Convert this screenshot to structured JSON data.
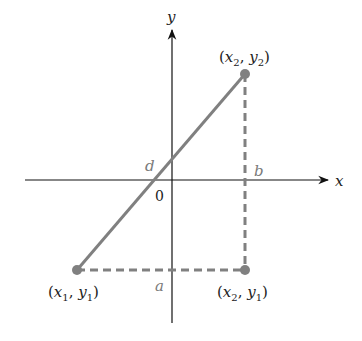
{
  "diagram": {
    "type": "distance-between-points",
    "axes": {
      "x_label": "x",
      "y_label": "y",
      "origin_label": "0"
    },
    "points": [
      {
        "id": "p1",
        "label": "(x1, y1)",
        "var_x": "x",
        "sub_x": "1",
        "var_y": "y",
        "sub_y": "1"
      },
      {
        "id": "p2",
        "label": "(x2, y2)",
        "var_x": "x",
        "sub_x": "2",
        "var_y": "y",
        "sub_y": "2"
      },
      {
        "id": "p3",
        "label": "(x2, y1)",
        "var_x": "x",
        "sub_x": "2",
        "var_y": "y",
        "sub_y": "1"
      }
    ],
    "segments": {
      "hypotenuse_label": "d",
      "horizontal_leg_label": "a",
      "vertical_leg_label": "b"
    },
    "colors": {
      "axis": "#111111",
      "segment": "#808080",
      "point": "#808080",
      "label": "#222222",
      "segment_label": "#7a7a7a"
    }
  }
}
